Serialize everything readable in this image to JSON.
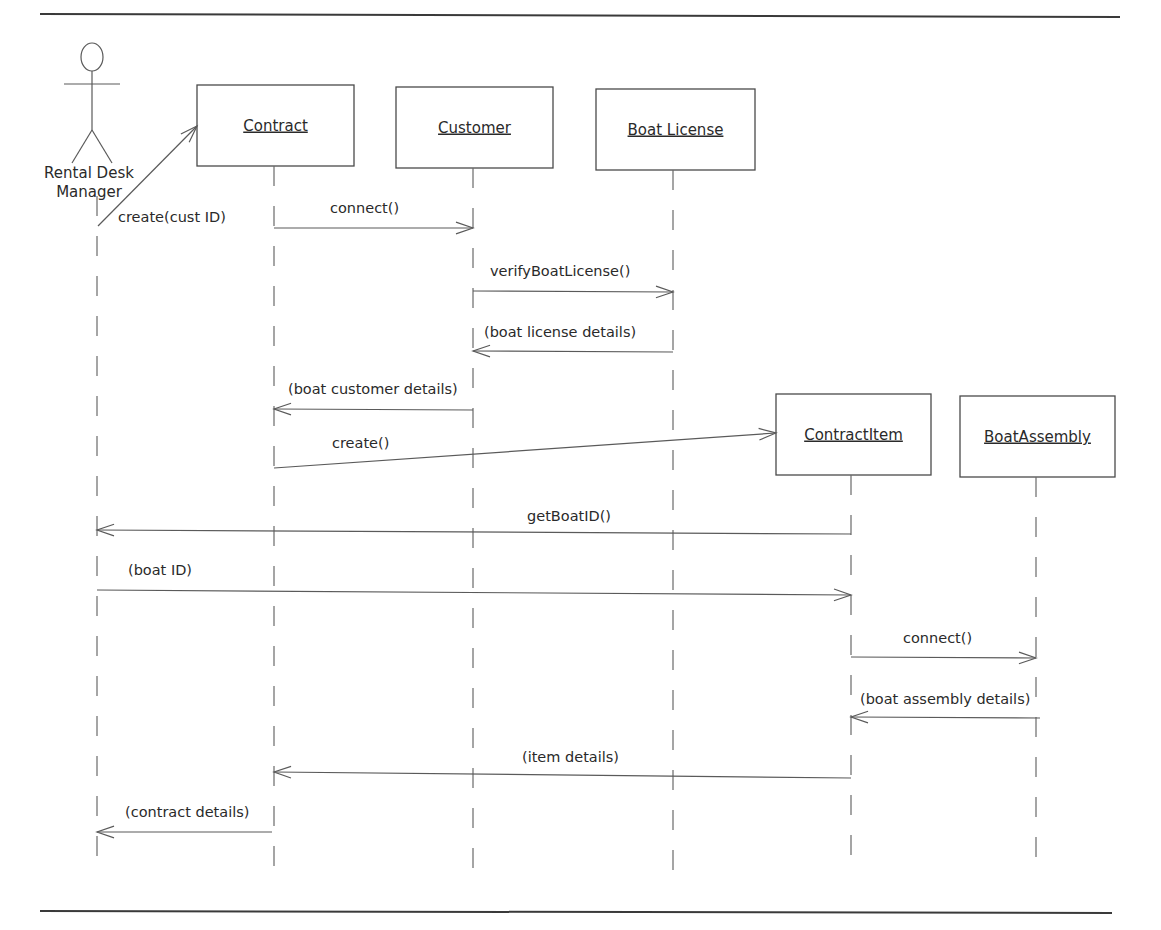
{
  "diagram": {
    "type": "uml-sequence-diagram",
    "rules": {
      "top": {
        "x1": 40,
        "x2": 1120,
        "y": 14
      },
      "bottom": {
        "x1": 40,
        "x2": 1112,
        "y": 913
      }
    },
    "actor": {
      "name_line1": "Rental Desk",
      "name_line2": "Manager",
      "x": 92,
      "lifeline_x": 97,
      "lifeline_top": 196,
      "lifeline_bottom": 875
    },
    "objects": [
      {
        "id": "contract",
        "label": "Contract",
        "x": 197,
        "y": 85,
        "w": 157,
        "h": 81,
        "lifeline_x": 274,
        "lifeline_bottom": 875
      },
      {
        "id": "customer",
        "label": "Customer",
        "x": 396,
        "y": 87,
        "w": 157,
        "h": 81,
        "lifeline_x": 473,
        "lifeline_bottom": 877
      },
      {
        "id": "boat-license",
        "label": "Boat License",
        "x": 596,
        "y": 89,
        "w": 159,
        "h": 81,
        "lifeline_x": 673,
        "lifeline_bottom": 877
      },
      {
        "id": "contract-item",
        "label": "ContractItem",
        "x": 776,
        "y": 394,
        "w": 155,
        "h": 81,
        "lifeline_x": 851,
        "lifeline_bottom": 860
      },
      {
        "id": "boat-assembly",
        "label": "BoatAssembly",
        "x": 960,
        "y": 396,
        "w": 155,
        "h": 81,
        "lifeline_x": 1036,
        "lifeline_bottom": 862
      }
    ],
    "messages": [
      {
        "id": "create-cust-id",
        "label": "create(cust ID)",
        "from": "Rental Desk Manager",
        "to": "Contract",
        "x1": 98,
        "y1": 226,
        "x2": 197,
        "y2": 126,
        "label_x": 118,
        "label_y": 222,
        "dir": "right"
      },
      {
        "id": "connect-1",
        "label": "connect()",
        "from": "Contract",
        "to": "Customer",
        "x1": 274,
        "y1": 228,
        "x2": 473,
        "y2": 228,
        "label_x": 330,
        "label_y": 213,
        "dir": "right"
      },
      {
        "id": "verify-boat-license",
        "label": "verifyBoatLicense()",
        "from": "Customer",
        "to": "Boat License",
        "x1": 473,
        "y1": 291,
        "x2": 673,
        "y2": 292,
        "label_x": 490,
        "label_y": 276,
        "dir": "right"
      },
      {
        "id": "boat-license-details",
        "label": "(boat license details)",
        "from": "Boat License",
        "to": "Customer",
        "x1": 673,
        "y1": 352,
        "x2": 473,
        "y2": 351,
        "label_x": 484,
        "label_y": 337,
        "dir": "left"
      },
      {
        "id": "boat-customer-details",
        "label": "(boat customer details)",
        "from": "Customer",
        "to": "Contract",
        "x1": 473,
        "y1": 410,
        "x2": 274,
        "y2": 409,
        "label_x": 288,
        "label_y": 394,
        "dir": "left"
      },
      {
        "id": "create-item",
        "label": "create()",
        "from": "Contract",
        "to": "ContractItem",
        "x1": 274,
        "y1": 468,
        "x2": 776,
        "y2": 433,
        "label_x": 332,
        "label_y": 448,
        "dir": "right"
      },
      {
        "id": "get-boat-id",
        "label": "getBoatID()",
        "from": "ContractItem",
        "to": "Rental Desk Manager",
        "x1": 851,
        "y1": 534,
        "x2": 97,
        "y2": 530,
        "label_x": 527,
        "label_y": 521,
        "dir": "left"
      },
      {
        "id": "boat-id",
        "label": "(boat ID)",
        "from": "Rental Desk Manager",
        "to": "ContractItem",
        "x1": 97,
        "y1": 590,
        "x2": 851,
        "y2": 595,
        "label_x": 128,
        "label_y": 575,
        "dir": "right"
      },
      {
        "id": "connect-2",
        "label": "connect()",
        "from": "ContractItem",
        "to": "BoatAssembly",
        "x1": 851,
        "y1": 657,
        "x2": 1036,
        "y2": 658,
        "label_x": 903,
        "label_y": 643,
        "dir": "right"
      },
      {
        "id": "boat-assembly-details",
        "label": "(boat assembly details)",
        "from": "BoatAssembly",
        "to": "ContractItem",
        "x1": 1040,
        "y1": 718,
        "x2": 851,
        "y2": 717,
        "label_x": 860,
        "label_y": 704,
        "dir": "left"
      },
      {
        "id": "item-details",
        "label": "(item details)",
        "from": "ContractItem",
        "to": "Contract",
        "x1": 851,
        "y1": 778,
        "x2": 274,
        "y2": 772,
        "label_x": 522,
        "label_y": 762,
        "dir": "left"
      },
      {
        "id": "contract-details",
        "label": "(contract details)",
        "from": "Contract",
        "to": "Rental Desk Manager",
        "x1": 272,
        "y1": 832,
        "x2": 97,
        "y2": 832,
        "label_x": 125,
        "label_y": 817,
        "dir": "left"
      }
    ]
  }
}
